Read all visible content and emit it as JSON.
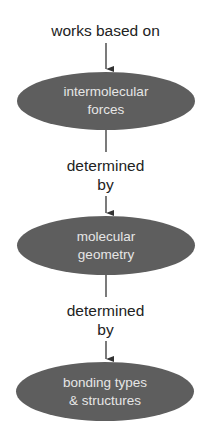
{
  "diagram": {
    "type": "flow-chain",
    "top_label": "works based on",
    "nodes": [
      {
        "id": "n1",
        "line1": "intermolecular",
        "line2": "forces"
      },
      {
        "id": "n2",
        "line1": "molecular",
        "line2": "geometry"
      },
      {
        "id": "n3",
        "line1": "bonding types",
        "line2": "& structures"
      }
    ],
    "edges": [
      {
        "from": "n1",
        "to": "n2",
        "line1": "determined",
        "line2": "by"
      },
      {
        "from": "n2",
        "to": "n3",
        "line1": "determined",
        "line2": "by"
      }
    ],
    "colors": {
      "node_fill": "#5e5e5e",
      "node_text": "#e6e6e6",
      "label_text": "#222222",
      "line": "#333333"
    }
  }
}
